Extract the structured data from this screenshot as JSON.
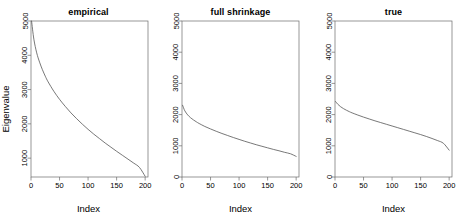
{
  "figure": {
    "background": "#ffffff",
    "line_color": "#555555",
    "axis_color": "#6b6b6b",
    "text_color": "#000000"
  },
  "chart_data": [
    {
      "type": "line",
      "title": "empirical",
      "xlabel": "Index",
      "ylabel": "Eigenvalue",
      "xlim": [
        0,
        205
      ],
      "ylim": [
        450,
        5000
      ],
      "grid": false,
      "legend": "none",
      "xticks": [
        0,
        50,
        100,
        150,
        200
      ],
      "xticklabels": [
        "0",
        "50",
        "100",
        "150",
        "200"
      ],
      "yticks": [
        1000,
        2000,
        3000,
        4000,
        5000
      ],
      "yticklabels": [
        "1000",
        "2000",
        "3000",
        "4000",
        "5000"
      ],
      "series": [
        {
          "name": "empirical eigenvalues",
          "x": [
            1,
            5,
            10,
            15,
            20,
            25,
            30,
            40,
            50,
            60,
            70,
            80,
            90,
            100,
            110,
            120,
            130,
            140,
            150,
            160,
            170,
            180,
            190,
            200
          ],
          "values": [
            5000,
            4470,
            4070,
            3800,
            3580,
            3390,
            3225,
            2950,
            2715,
            2510,
            2320,
            2150,
            1990,
            1840,
            1700,
            1570,
            1440,
            1320,
            1200,
            1085,
            970,
            855,
            730,
            470
          ]
        }
      ]
    },
    {
      "type": "line",
      "title": "full shrinkage",
      "xlabel": "Index",
      "ylabel": "",
      "xlim": [
        0,
        205
      ],
      "ylim": [
        0,
        5000
      ],
      "grid": false,
      "legend": "none",
      "xticks": [
        0,
        50,
        100,
        150,
        200
      ],
      "xticklabels": [
        "0",
        "50",
        "100",
        "150",
        "200"
      ],
      "yticks": [
        0,
        1000,
        2000,
        3000,
        4000,
        5000
      ],
      "yticklabels": [
        "0",
        "1000",
        "2000",
        "3000",
        "4000",
        "5000"
      ],
      "series": [
        {
          "name": "full shrinkage eigenvalues",
          "x": [
            1,
            5,
            10,
            15,
            20,
            25,
            30,
            40,
            50,
            60,
            70,
            80,
            90,
            100,
            110,
            120,
            130,
            140,
            150,
            160,
            170,
            180,
            190,
            200
          ],
          "values": [
            2300,
            2120,
            1990,
            1900,
            1830,
            1770,
            1715,
            1620,
            1540,
            1465,
            1395,
            1330,
            1265,
            1205,
            1145,
            1090,
            1035,
            985,
            935,
            885,
            840,
            790,
            745,
            660
          ]
        }
      ]
    },
    {
      "type": "line",
      "title": "true",
      "xlabel": "Index",
      "ylabel": "",
      "xlim": [
        0,
        205
      ],
      "ylim": [
        0,
        5000
      ],
      "grid": false,
      "legend": "none",
      "xticks": [
        0,
        50,
        100,
        150,
        200
      ],
      "xticklabels": [
        "0",
        "50",
        "100",
        "150",
        "200"
      ],
      "yticks": [
        0,
        1000,
        2000,
        3000,
        4000,
        5000
      ],
      "yticklabels": [
        "0",
        "1000",
        "2000",
        "3000",
        "4000",
        "5000"
      ],
      "series": [
        {
          "name": "true eigenvalues",
          "x": [
            1,
            5,
            10,
            15,
            20,
            25,
            30,
            40,
            50,
            60,
            70,
            80,
            90,
            100,
            110,
            120,
            130,
            140,
            150,
            160,
            170,
            180,
            190,
            200
          ],
          "values": [
            2420,
            2330,
            2250,
            2190,
            2140,
            2095,
            2055,
            1985,
            1920,
            1860,
            1800,
            1745,
            1690,
            1635,
            1580,
            1525,
            1470,
            1415,
            1360,
            1300,
            1235,
            1165,
            1080,
            860
          ]
        }
      ]
    }
  ]
}
